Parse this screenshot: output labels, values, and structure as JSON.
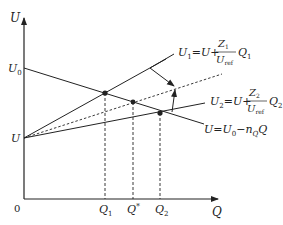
{
  "diagram": {
    "axes": {
      "y_label": "U",
      "x_label": "Q",
      "origin_label": "0"
    },
    "y_ticks": {
      "u0": {
        "base": "U",
        "sub": "0"
      },
      "u": "U"
    },
    "x_ticks": {
      "q1": {
        "base": "Q",
        "sub": "1"
      },
      "qstar": {
        "base": "Q",
        "sup": "*"
      },
      "q2": {
        "base": "Q",
        "sub": "2"
      }
    },
    "equations": {
      "u1": {
        "lhs": "U",
        "lhs_sub": "1",
        "rhs_prefix": "=U+",
        "numerator": "Z",
        "numerator_sub": "1",
        "denominator": "U",
        "denominator_sub": "ref",
        "suffix": "Q",
        "suffix_sub": "1"
      },
      "u2": {
        "lhs": "U",
        "lhs_sub": "2",
        "rhs_prefix": "=U+",
        "numerator": "Z",
        "numerator_sub": "2",
        "denominator": "U",
        "denominator_sub": "ref",
        "suffix": "Q",
        "suffix_sub": "2"
      },
      "u": {
        "text": "U=U",
        "sub0": "0",
        "minus": "−n",
        "n_sub": "Q",
        "suffix": "Q"
      }
    },
    "colors": {
      "line": "#222222",
      "background": "#ffffff"
    }
  }
}
